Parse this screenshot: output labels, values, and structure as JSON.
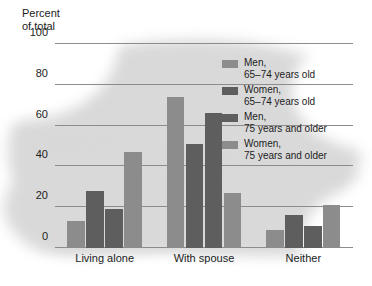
{
  "chart_data": {
    "type": "bar",
    "title": "Percent\nof total",
    "xlabel": "",
    "ylabel": "Percent of total",
    "ylim": [
      0,
      100
    ],
    "yticks": [
      0,
      20,
      40,
      60,
      80,
      100
    ],
    "grid": true,
    "legend_position": "top-right inside plot",
    "categories": [
      "Living alone",
      "With spouse",
      "Neither"
    ],
    "series": [
      {
        "name": "Men,\n65–74 years old",
        "color": "#8c8c8c",
        "values": [
          13,
          74,
          9
        ]
      },
      {
        "name": "Women,\n65–74 years old",
        "color": "#5e5e5e",
        "values": [
          28,
          51,
          16
        ]
      },
      {
        "name": "Men,\n75 years and older",
        "color": "#5e5e5e",
        "values": [
          19,
          66,
          11
        ]
      },
      {
        "name": "Women,\n75 years and older",
        "color": "#8c8c8c",
        "values": [
          47,
          27,
          21
        ]
      }
    ]
  },
  "axis": {
    "title": "Percent\nof total",
    "tick_labels": [
      "0",
      "20",
      "40",
      "60",
      "80",
      "100"
    ]
  },
  "legend": {
    "items": [
      {
        "label": "Men,\n65–74 years old"
      },
      {
        "label": "Women,\n65–74 years old"
      },
      {
        "label": "Men,\n75 years and older"
      },
      {
        "label": "Women,\n75 years and older"
      }
    ]
  },
  "colors": {
    "light_gray_series": "#8c8c8c",
    "dark_gray_series": "#5e5e5e",
    "gridline": "#8c8c8c",
    "backdrop_blob": "#d9d9d9",
    "text": "#1c1c1c",
    "page_background": "#ffffff"
  }
}
